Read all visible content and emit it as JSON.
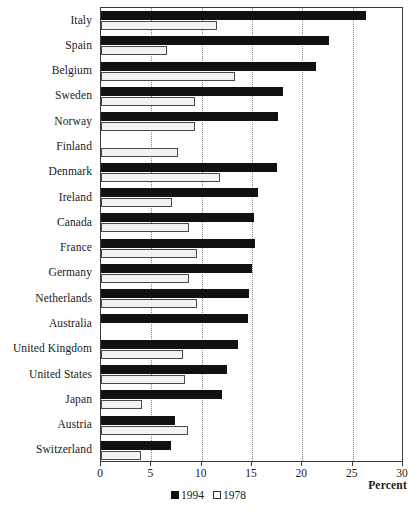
{
  "chart_data": {
    "type": "bar",
    "orientation": "horizontal",
    "title": "",
    "xlabel": "Percent",
    "ylabel": "",
    "xlim": [
      0,
      30
    ],
    "xticks": [
      0,
      5,
      10,
      15,
      20,
      25,
      30
    ],
    "xtick_labels": [
      "0",
      "5",
      "10",
      "15",
      "20",
      "25",
      "30"
    ],
    "grid": "vertical-dotted",
    "legend_position": "bottom-center",
    "categories": [
      "Italy",
      "Spain",
      "Belgium",
      "Sweden",
      "Norway",
      "Finland",
      "Denmark",
      "Ireland",
      "Canada",
      "France",
      "Germany",
      "Netherlands",
      "Australia",
      "United Kingdom",
      "United States",
      "Japan",
      "Austria",
      "Switzerland"
    ],
    "series": [
      {
        "name": "1994",
        "color": "#111111",
        "values": [
          26.3,
          22.6,
          21.4,
          18.1,
          17.6,
          null,
          17.5,
          15.6,
          15.2,
          15.3,
          15.0,
          14.7,
          14.6,
          13.6,
          12.5,
          12.0,
          7.4,
          7.0
        ]
      },
      {
        "name": "1978",
        "color": "#ffffff",
        "values": [
          11.5,
          6.6,
          13.3,
          9.3,
          9.3,
          7.6,
          11.8,
          7.1,
          8.7,
          9.5,
          8.7,
          9.5,
          null,
          8.1,
          8.3,
          4.1,
          8.6,
          4.0
        ]
      }
    ]
  },
  "legend": {
    "items": [
      {
        "label": "1994",
        "swatch": "filled-square-icon"
      },
      {
        "label": "1978",
        "swatch": "empty-square-icon"
      }
    ]
  },
  "axis": {
    "x_title": "Percent"
  }
}
